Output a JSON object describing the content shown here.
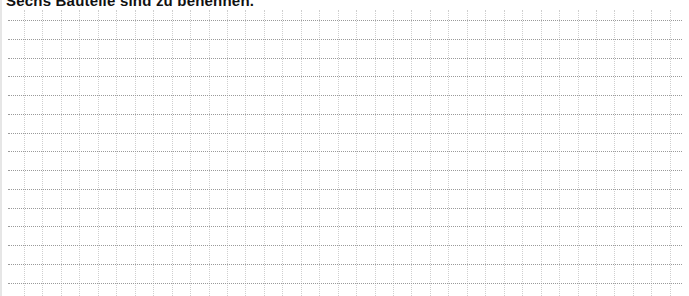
{
  "worksheet": {
    "title": "Sechs Bauteile sind zu benennen.",
    "grid": {
      "type": "writing-grid",
      "horizontal_line_count": 15,
      "vertical_line_count": 36,
      "line_color": "#9a9a9a",
      "vertical_line_color": "#cfcfcf",
      "first_horizontal_y": 20,
      "horizontal_spacing": 18.75,
      "first_vertical_x": 24,
      "vertical_spacing": 18.45
    }
  }
}
